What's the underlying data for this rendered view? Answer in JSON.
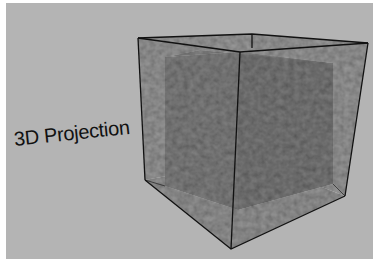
{
  "figure": {
    "label": "3D Projection",
    "colors": {
      "background": "#b4b4b4",
      "outer_face": "#8a8a8a",
      "inner_face": "#6a6a6a",
      "edge": "#111111"
    }
  }
}
